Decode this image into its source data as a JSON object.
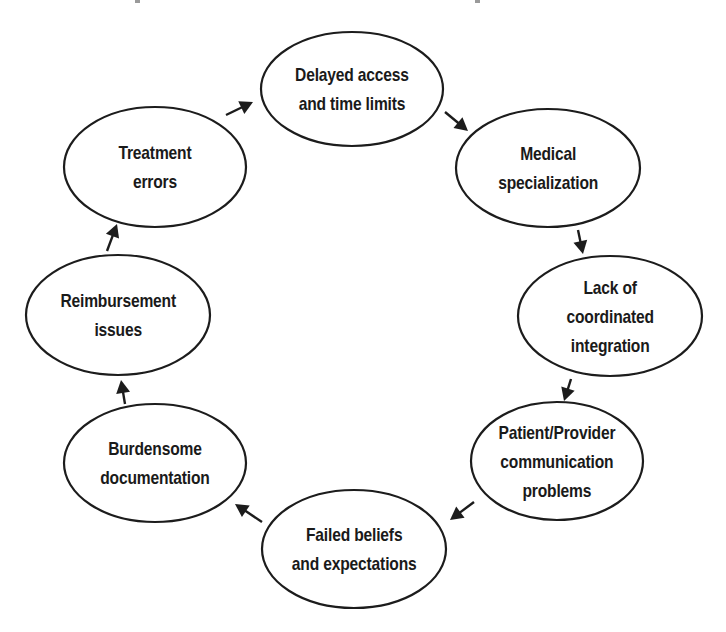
{
  "diagram": {
    "type": "cycle",
    "direction": "clockwise",
    "stroke_color": "#1c1c1c",
    "background_color": "#ffffff",
    "nodes": [
      {
        "id": "delayed-access",
        "lines": [
          "Delayed access",
          "and time limits"
        ],
        "cx": 352,
        "cy": 89,
        "rx": 91,
        "ry": 57
      },
      {
        "id": "medical-specialization",
        "lines": [
          "Medical",
          "specialization"
        ],
        "cx": 548,
        "cy": 168,
        "rx": 92,
        "ry": 59
      },
      {
        "id": "lack-of-coordinated-integration",
        "lines": [
          "Lack of",
          "coordinated",
          "integration"
        ],
        "cx": 610,
        "cy": 316,
        "rx": 92,
        "ry": 60
      },
      {
        "id": "patient-provider-communication",
        "lines": [
          "Patient/Provider",
          "communication",
          "problems"
        ],
        "cx": 557,
        "cy": 461,
        "rx": 86,
        "ry": 59
      },
      {
        "id": "failed-beliefs",
        "lines": [
          "Failed beliefs",
          "and expectations"
        ],
        "cx": 354,
        "cy": 549,
        "rx": 92,
        "ry": 59
      },
      {
        "id": "burdensome-documentation",
        "lines": [
          "Burdensome",
          "documentation"
        ],
        "cx": 155,
        "cy": 463,
        "rx": 91,
        "ry": 59
      },
      {
        "id": "reimbursement-issues",
        "lines": [
          "Reimbursement",
          "issues"
        ],
        "cx": 118,
        "cy": 315,
        "rx": 92,
        "ry": 60
      },
      {
        "id": "treatment-errors",
        "lines": [
          "Treatment",
          "errors"
        ],
        "cx": 155,
        "cy": 167,
        "rx": 91,
        "ry": 60
      }
    ],
    "edges": [
      {
        "from": "delayed-access",
        "to": "medical-specialization",
        "x1": 445,
        "y1": 112,
        "x2": 468,
        "y2": 131
      },
      {
        "from": "medical-specialization",
        "to": "lack-of-coordinated-integration",
        "x1": 578,
        "y1": 230,
        "x2": 583,
        "y2": 254
      },
      {
        "from": "lack-of-coordinated-integration",
        "to": "patient-provider-communication",
        "x1": 571,
        "y1": 379,
        "x2": 564,
        "y2": 401
      },
      {
        "from": "patient-provider-communication",
        "to": "failed-beliefs",
        "x1": 474,
        "y1": 502,
        "x2": 450,
        "y2": 520
      },
      {
        "from": "failed-beliefs",
        "to": "burdensome-documentation",
        "x1": 262,
        "y1": 522,
        "x2": 235,
        "y2": 504
      },
      {
        "from": "burdensome-documentation",
        "to": "reimbursement-issues",
        "x1": 125,
        "y1": 404,
        "x2": 121,
        "y2": 380
      },
      {
        "from": "reimbursement-issues",
        "to": "treatment-errors",
        "x1": 107,
        "y1": 251,
        "x2": 117,
        "y2": 224
      },
      {
        "from": "treatment-errors",
        "to": "delayed-access",
        "x1": 226,
        "y1": 115,
        "x2": 253,
        "y2": 102
      }
    ]
  }
}
